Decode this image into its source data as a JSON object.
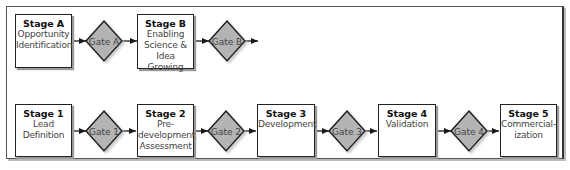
{
  "diagram": {
    "type": "stage-gate process flowchart",
    "top_row": {
      "stages": [
        {
          "id": "A",
          "title": "Stage A",
          "description": "Opportunity\nIdentification"
        },
        {
          "id": "B",
          "title": "Stage B",
          "description": "Enabling\nScience &\nIdea Growing"
        }
      ],
      "gates": [
        {
          "id": "A",
          "label": "Gate A"
        },
        {
          "id": "B",
          "label": "Gate B"
        }
      ],
      "flow": [
        "Stage A",
        "Gate A",
        "Stage B",
        "Gate B",
        "→"
      ]
    },
    "bottom_row": {
      "stages": [
        {
          "id": "1",
          "title": "Stage 1",
          "description": "Lead\nDefinition"
        },
        {
          "id": "2",
          "title": "Stage 2",
          "description": "Pre-\ndevelopment\nAssessment"
        },
        {
          "id": "3",
          "title": "Stage 3",
          "description": "Development"
        },
        {
          "id": "4",
          "title": "Stage 4",
          "description": "Validation"
        },
        {
          "id": "5",
          "title": "Stage 5",
          "description": "Commercial-\nization"
        }
      ],
      "gates": [
        {
          "id": "1",
          "label": "Gate 1"
        },
        {
          "id": "2",
          "label": "Gate 2"
        },
        {
          "id": "3",
          "label": "Gate 3"
        },
        {
          "id": "4",
          "label": "Gate 4"
        }
      ],
      "flow": [
        "Stage 1",
        "Gate 1",
        "Stage 2",
        "Gate 2",
        "Stage 3",
        "Gate 3",
        "Stage 4",
        "Gate 4",
        "Stage 5"
      ]
    },
    "colors": {
      "gate_fill": "#b4b4b4",
      "gate_stroke": "#1a1a1a",
      "stage_fill": "#ffffff",
      "stage_stroke": "#222222",
      "shadow": "#9a9a9a",
      "arrow": "#1a1a1a",
      "gate_text": "#444444"
    }
  }
}
